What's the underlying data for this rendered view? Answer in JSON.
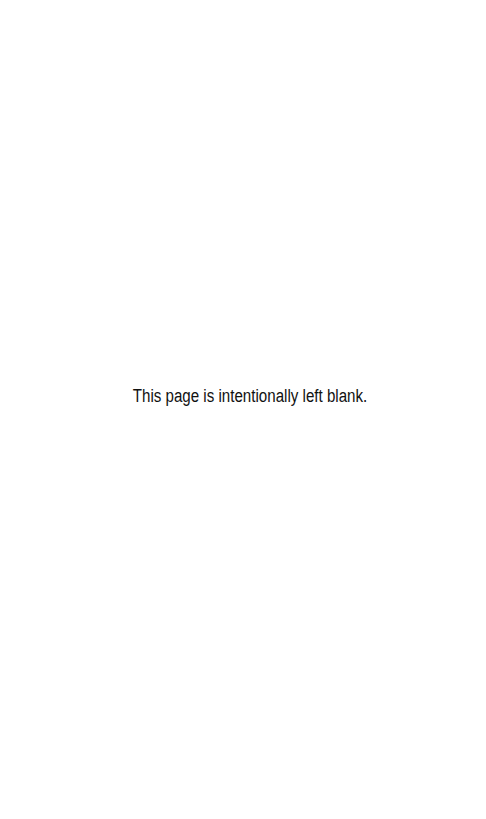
{
  "page": {
    "notice": "This page is intentionally left blank.",
    "background_color": "#ffffff",
    "text_color": "#111111"
  }
}
